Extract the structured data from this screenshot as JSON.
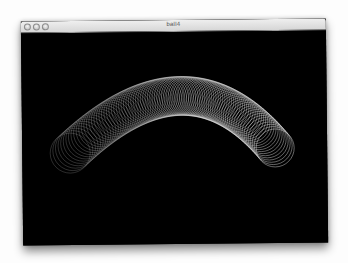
{
  "window": {
    "title": "ball4",
    "buttons": [
      {
        "name": "close",
        "color": "#c8c8c8"
      },
      {
        "name": "minimize",
        "color": "#c8c8c8"
      },
      {
        "name": "zoom",
        "color": "#c8c8c8"
      }
    ]
  },
  "canvas": {
    "background": "#000000",
    "stroke_color": "#ffffff",
    "trajectory": {
      "shape": "parabolic-arc",
      "start": {
        "x": 48,
        "y": 120,
        "r": 20
      },
      "apex": {
        "x": 158,
        "y": 64,
        "r": 20
      },
      "end": {
        "x": 253,
        "y": 117,
        "r": 19
      },
      "circle_count": 90,
      "stroke_opacity_start": 0.35,
      "stroke_opacity_end": 0.8
    }
  }
}
